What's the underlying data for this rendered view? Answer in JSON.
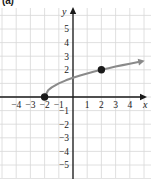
{
  "figure": {
    "part_label": "(a)",
    "axis_x_name": "x",
    "axis_y_name": "y"
  },
  "chart_data": {
    "type": "line",
    "title": "",
    "xlabel": "x",
    "ylabel": "y",
    "xlim": [
      -5,
      5
    ],
    "ylim": [
      -6,
      6
    ],
    "grid": true,
    "legend": "none",
    "x_ticks": [
      -4,
      -3,
      -2,
      -1,
      1,
      2,
      3,
      4
    ],
    "x_tick_labels": [
      "-4",
      "-3",
      "-2",
      "-1",
      "1",
      "2",
      "3",
      "4"
    ],
    "y_ticks": [
      5,
      4,
      3,
      2,
      -1,
      -2,
      -3,
      -4,
      -5
    ],
    "y_tick_labels": [
      "5",
      "4",
      "3",
      "2",
      "-1",
      "-2",
      "-3",
      "-4",
      "-5"
    ],
    "series": [
      {
        "name": "curve",
        "equation": "y = sqrt(x + 2)",
        "color": "#8a8a8a",
        "arrow_end": "right",
        "points": [
          {
            "x": -2,
            "y": 0
          },
          {
            "x": -1.75,
            "y": 0.5
          },
          {
            "x": -1.5,
            "y": 0.707
          },
          {
            "x": -1,
            "y": 1
          },
          {
            "x": -0.5,
            "y": 1.225
          },
          {
            "x": 0,
            "y": 1.414
          },
          {
            "x": 0.5,
            "y": 1.581
          },
          {
            "x": 1,
            "y": 1.732
          },
          {
            "x": 1.5,
            "y": 1.871
          },
          {
            "x": 2,
            "y": 2
          },
          {
            "x": 2.5,
            "y": 2.121
          },
          {
            "x": 3,
            "y": 2.236
          },
          {
            "x": 3.5,
            "y": 2.345
          },
          {
            "x": 4,
            "y": 2.449
          },
          {
            "x": 4.6,
            "y": 2.569
          }
        ]
      }
    ],
    "marked_points": [
      {
        "x": -2,
        "y": 0,
        "style": "closed",
        "color": "#1a1a1a"
      },
      {
        "x": 2,
        "y": 2,
        "style": "closed",
        "color": "#1a1a1a"
      }
    ],
    "grid_color": "#d8d8d8",
    "axis_color": "#1a1a1a",
    "curve_color": "#8a8a8a"
  }
}
